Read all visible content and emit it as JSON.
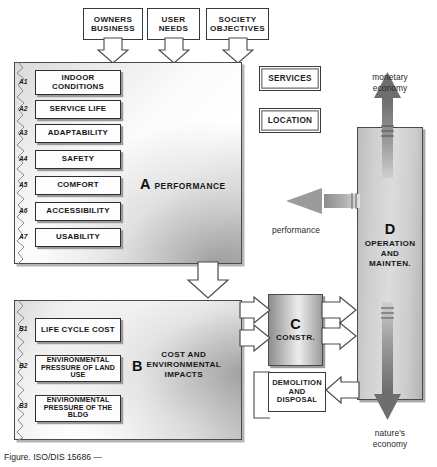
{
  "figure": {
    "caption": "Figure. ISO/DIS 15686 — ",
    "colors": {
      "panel_a_fill": "#e8e8e8",
      "panel_b_fill": "#ededed",
      "panel_c_fill": "#bdbdbd",
      "panel_d_fill": "#cfcfcf",
      "outline": "#3a3a3a",
      "arrow_gray": "#6f6f6f",
      "text": "#161616"
    }
  },
  "inputs": [
    {
      "id": "owners-business",
      "line1": "OWNERS",
      "line2": "BUSINESS"
    },
    {
      "id": "user-needs",
      "line1": "USER",
      "line2": "NEEDS"
    },
    {
      "id": "society-objectives",
      "line1": "SOCIETY",
      "line2": "OBJECTIVES"
    }
  ],
  "panel_a": {
    "letter": "A",
    "label": "PERFORMANCE",
    "items": [
      {
        "tag": "A1",
        "text": "INDOOR CONDITIONS"
      },
      {
        "tag": "A2",
        "text": "SERVICE LIFE"
      },
      {
        "tag": "A3",
        "text": "ADAPTABILITY"
      },
      {
        "tag": "A4",
        "text": "SAFETY"
      },
      {
        "tag": "A5",
        "text": "COMFORT"
      },
      {
        "tag": "A6",
        "text": "ACCESSIBILITY"
      },
      {
        "tag": "A7",
        "text": "USABILITY"
      }
    ]
  },
  "panel_b": {
    "letter": "B",
    "label_line1": "COST AND",
    "label_line2": "ENVIRONMENTAL",
    "label_line3": "IMPACTS",
    "items": [
      {
        "tag": "B1",
        "text": "LIFE CYCLE COST"
      },
      {
        "tag": "B2",
        "line1": "ENVIRONMENTAL",
        "line2": "PRESSURE OF LAND USE"
      },
      {
        "tag": "B3",
        "line1": "ENVIRONMENTAL",
        "line2": "PRESSURE OF THE BLDG"
      }
    ]
  },
  "panel_c": {
    "letter": "C",
    "label": "CONSTR."
  },
  "panel_d": {
    "letter": "D",
    "label_line1": "OPERATION",
    "label_line2": "AND",
    "label_line3": "MAINTEN."
  },
  "context_boxes": [
    {
      "id": "services",
      "text": "SERVICES"
    },
    {
      "id": "location",
      "text": "LOCATION"
    }
  ],
  "demolition": {
    "line1": "DEMOLITION",
    "line2": "AND",
    "line3": "DISPOSAL"
  },
  "annotations": {
    "performance_flow": "performance",
    "monetary_line1": "monetary",
    "monetary_line2": "economy",
    "nature_line1": "nature's",
    "nature_line2": "economy"
  }
}
